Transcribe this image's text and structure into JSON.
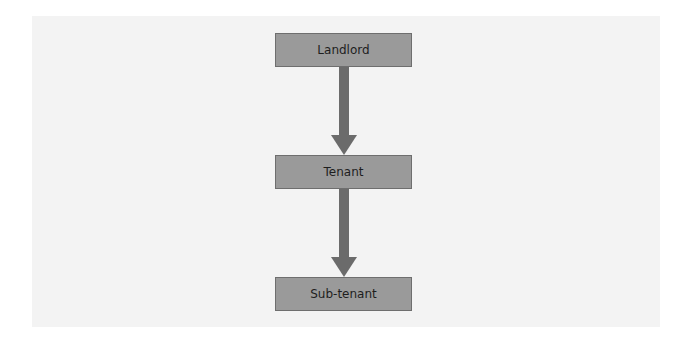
{
  "diagram": {
    "type": "hierarchy-flow",
    "direction": "top-to-bottom",
    "nodes": [
      {
        "id": "landlord",
        "label": "Landlord"
      },
      {
        "id": "tenant",
        "label": "Tenant"
      },
      {
        "id": "sub-tenant",
        "label": "Sub-tenant"
      }
    ],
    "edges": [
      {
        "from": "landlord",
        "to": "tenant"
      },
      {
        "from": "tenant",
        "to": "sub-tenant"
      }
    ],
    "colors": {
      "panel_background": "#f3f3f3",
      "node_fill": "#9a9a9a",
      "node_border": "#6e6e6e",
      "arrow": "#6b6b6b",
      "text": "#1e1e1e"
    }
  }
}
